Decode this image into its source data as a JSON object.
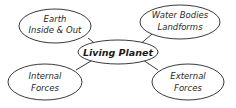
{
  "diagram": {
    "type": "concept-map",
    "center": {
      "id": "living-planet",
      "lines": [
        "Living Planet"
      ]
    },
    "nodes": [
      {
        "id": "earth-inside-out",
        "lines": [
          "Earth",
          "Inside & Out"
        ]
      },
      {
        "id": "water-bodies-landforms",
        "lines": [
          "Water Bodies",
          "Landforms"
        ]
      },
      {
        "id": "internal-forces",
        "lines": [
          "Internal",
          "Forces"
        ]
      },
      {
        "id": "external-forces",
        "lines": [
          "External",
          "Forces"
        ]
      }
    ],
    "edges": [
      {
        "from": "living-planet",
        "to": "earth-inside-out"
      },
      {
        "from": "living-planet",
        "to": "water-bodies-landforms"
      },
      {
        "from": "living-planet",
        "to": "internal-forces"
      },
      {
        "from": "living-planet",
        "to": "external-forces"
      }
    ],
    "colors": {
      "stroke": "#3a3a3a",
      "fill": "#ffffff",
      "text": "#2a2a2a"
    }
  }
}
